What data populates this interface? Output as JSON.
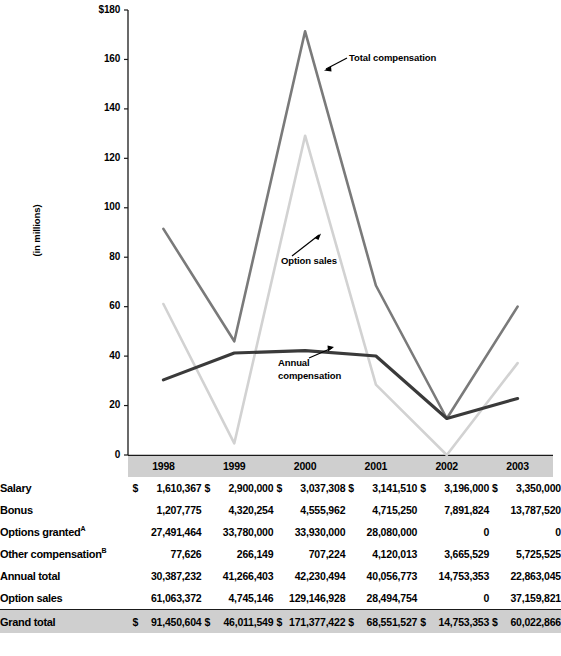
{
  "chart_data": {
    "type": "line",
    "title": "",
    "xlabel": "",
    "ylabel": "(in millions)",
    "categories": [
      "1998",
      "1999",
      "2000",
      "2001",
      "2002",
      "2003"
    ],
    "ylim": [
      0,
      180
    ],
    "yticks": [
      "0",
      "20",
      "40",
      "60",
      "80",
      "100",
      "120",
      "140",
      "160",
      "$180"
    ],
    "ytick_values": [
      0,
      20,
      40,
      60,
      80,
      100,
      120,
      140,
      160,
      180
    ],
    "grid": false,
    "legend_position": "annotations-inline",
    "series": [
      {
        "name": "Total compensation",
        "color": "#7a7a7a",
        "values": [
          91.45,
          46.01,
          171.38,
          68.55,
          14.75,
          60.02
        ]
      },
      {
        "name": "Option sales",
        "color": "#d2d2d2",
        "values": [
          61.06,
          4.75,
          129.15,
          28.49,
          0,
          37.16
        ]
      },
      {
        "name": "Annual compensation",
        "color": "#3a3a3a",
        "values": [
          30.39,
          41.27,
          42.23,
          40.06,
          14.75,
          22.86
        ]
      }
    ],
    "annotations": [
      {
        "text": "Total compensation",
        "series": "Total compensation"
      },
      {
        "text": "Option sales",
        "series": "Option sales"
      },
      {
        "text": "Annual\ncompensation",
        "series": "Annual compensation"
      }
    ]
  },
  "table": {
    "columns": [
      "1998",
      "1999",
      "2000",
      "2001",
      "2002",
      "2003"
    ],
    "rows": [
      {
        "label": "Salary",
        "sup": "",
        "dollar": true,
        "values": [
          "1,610,367",
          "2,900,000",
          "3,037,308",
          "3,141,510",
          "3,196,000",
          "3,350,000"
        ]
      },
      {
        "label": "Bonus",
        "sup": "",
        "dollar": false,
        "values": [
          "1,207,775",
          "4,320,254",
          "4,555,962",
          "4,715,250",
          "7,891,824",
          "13,787,520"
        ]
      },
      {
        "label": "Options granted",
        "sup": "A",
        "dollar": false,
        "values": [
          "27,491,464",
          "33,780,000",
          "33,930,000",
          "28,080,000",
          "0",
          "0"
        ]
      },
      {
        "label": "Other compensation",
        "sup": "B",
        "dollar": false,
        "values": [
          "77,626",
          "266,149",
          "707,224",
          "4,120,013",
          "3,665,529",
          "5,725,525"
        ]
      },
      {
        "label": "Annual total",
        "sup": "",
        "dollar": false,
        "values": [
          "30,387,232",
          "41,266,403",
          "42,230,494",
          "40,056,773",
          "14,753,353",
          "22,863,045"
        ]
      },
      {
        "label": "Option sales",
        "sup": "",
        "dollar": false,
        "values": [
          "61,063,372",
          "4,745,146",
          "129,146,928",
          "28,494,754",
          "0",
          "37,159,821"
        ]
      },
      {
        "label": "Grand total",
        "sup": "",
        "dollar": true,
        "grand": true,
        "values": [
          "91,450,604",
          "46,011,549",
          "171,377,422",
          "68,551,527",
          "14,753,353",
          "60,022,866"
        ]
      }
    ],
    "dollar_sign": "$"
  }
}
